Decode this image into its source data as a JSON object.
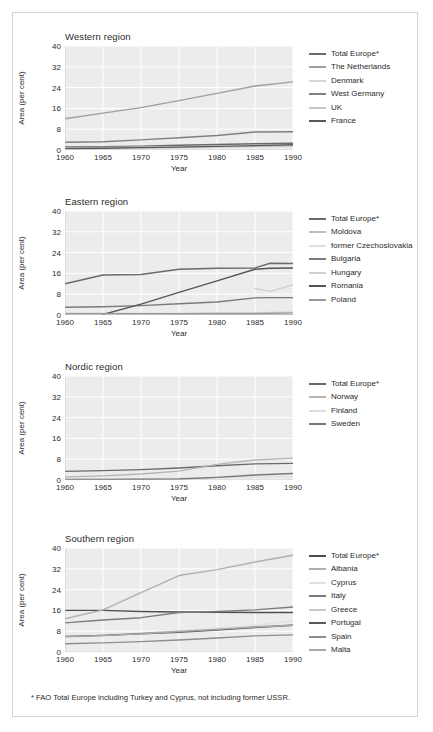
{
  "figure": {
    "footnote": "* FAO Total Europe including Turkey and Cyprus, not including former USSR.",
    "y_axis_label": "Area (per cent)",
    "x_axis_label": "Year"
  },
  "chart_data": [
    {
      "type": "line",
      "title": "Western region",
      "xlabel": "Year",
      "ylabel": "Area (per cent)",
      "xlim": [
        1960,
        1990
      ],
      "ylim": [
        0,
        40
      ],
      "xticks": [
        1960,
        1965,
        1970,
        1975,
        1980,
        1985,
        1990
      ],
      "yticks": [
        0,
        8,
        16,
        24,
        32,
        40
      ],
      "grid": true,
      "legend_position": "right",
      "x": [
        1960,
        1965,
        1970,
        1975,
        1980,
        1985,
        1990
      ],
      "series": [
        {
          "name": "Total Europe*",
          "color": "#6a6a6a",
          "values": [
            1.2,
            1.3,
            1.5,
            1.8,
            2.1,
            2.4,
            2.6
          ]
        },
        {
          "name": "The Netherlands",
          "color": "#9f9f9f",
          "values": [
            12.0,
            14.2,
            16.3,
            19.0,
            21.8,
            24.6,
            26.2
          ]
        },
        {
          "name": "Denmark",
          "color": "#d8d8d8",
          "values": [
            0.4,
            0.5,
            0.6,
            0.8,
            1.0,
            1.2,
            1.4
          ]
        },
        {
          "name": "West Germany",
          "color": "#808080",
          "values": [
            3.0,
            3.2,
            3.9,
            4.7,
            5.6,
            6.9,
            7.0
          ]
        },
        {
          "name": "UK",
          "color": "#c6c6c6",
          "values": [
            0.9,
            1.0,
            1.1,
            1.2,
            1.3,
            1.4,
            1.5
          ]
        },
        {
          "name": "France",
          "color": "#595959",
          "values": [
            0.6,
            0.7,
            0.9,
            1.1,
            1.4,
            1.7,
            2.0
          ]
        }
      ]
    },
    {
      "type": "line",
      "title": "Eastern region",
      "xlabel": "Year",
      "ylabel": "Area (per cent)",
      "xlim": [
        1960,
        1990
      ],
      "ylim": [
        0,
        40
      ],
      "xticks": [
        1960,
        1965,
        1970,
        1975,
        1980,
        1985,
        1990
      ],
      "yticks": [
        0,
        8,
        16,
        24,
        32,
        40
      ],
      "grid": true,
      "legend_position": "right",
      "x": [
        1960,
        1965,
        1970,
        1975,
        1980,
        1985,
        1987,
        1990
      ],
      "series": [
        {
          "name": "Total Europe*",
          "color": "#6a6a6a",
          "values": [
            12.0,
            15.4,
            15.6,
            17.6,
            18.0,
            18.1,
            19.9,
            19.8
          ]
        },
        {
          "name": "Moldova",
          "color": "#bfbfbf",
          "values": [
            0.6,
            0.6,
            0.5,
            0.4,
            0.3,
            0.2,
            0.1,
            0.1
          ]
        },
        {
          "name": "former Czechoslovakia",
          "color": "#e0e0e0",
          "values": [
            0.5,
            0.5,
            0.6,
            0.7,
            0.8,
            0.9,
            1.1,
            1.4
          ]
        },
        {
          "name": "Bulgaria",
          "color": "#7a7a7a",
          "values": [
            3.0,
            3.2,
            3.6,
            4.3,
            5.0,
            6.6,
            6.7,
            6.7
          ]
        },
        {
          "name": "Hungary",
          "color": "#cfcfcf",
          "values": [
            null,
            null,
            null,
            null,
            null,
            10.2,
            9.1,
            11.6
          ]
        },
        {
          "name": "Romania",
          "color": "#555555",
          "values": [
            null,
            0.2,
            4.2,
            8.7,
            13.1,
            17.6,
            18.0,
            18.1
          ]
        },
        {
          "name": "Poland",
          "color": "#999999",
          "values": [
            0.5,
            0.5,
            0.5,
            0.5,
            0.6,
            0.6,
            0.7,
            0.8
          ]
        }
      ]
    },
    {
      "type": "line",
      "title": "Nordic region",
      "xlabel": "Year",
      "ylabel": "Area (per cent)",
      "xlim": [
        1960,
        1990
      ],
      "ylim": [
        0,
        40
      ],
      "xticks": [
        1960,
        1965,
        1970,
        1975,
        1980,
        1985,
        1990
      ],
      "yticks": [
        0,
        8,
        16,
        24,
        32,
        40
      ],
      "grid": true,
      "legend_position": "right",
      "x": [
        1960,
        1965,
        1970,
        1975,
        1980,
        1985,
        1990
      ],
      "series": [
        {
          "name": "Total Europe*",
          "color": "#6a6a6a",
          "values": [
            3.3,
            3.6,
            4.0,
            4.6,
            5.5,
            6.2,
            6.4
          ]
        },
        {
          "name": "Norway",
          "color": "#b5b5b5",
          "values": [
            1.2,
            1.6,
            2.3,
            3.4,
            6.0,
            7.7,
            8.4
          ]
        },
        {
          "name": "Finland",
          "color": "#dedede",
          "values": [
            0.3,
            0.4,
            0.5,
            0.7,
            0.9,
            1.1,
            1.3
          ]
        },
        {
          "name": "Sweden",
          "color": "#777777",
          "values": [
            0.2,
            0.2,
            0.3,
            0.4,
            1.0,
            1.9,
            2.5
          ]
        }
      ]
    },
    {
      "type": "line",
      "title": "Southern region",
      "xlabel": "Year",
      "ylabel": "Area (per cent)",
      "xlim": [
        1960,
        1990
      ],
      "ylim": [
        0,
        40
      ],
      "xticks": [
        1960,
        1965,
        1970,
        1975,
        1980,
        1985,
        1990
      ],
      "yticks": [
        0,
        8,
        16,
        24,
        32,
        40
      ],
      "grid": true,
      "legend_position": "right",
      "x": [
        1960,
        1965,
        1970,
        1975,
        1980,
        1985,
        1990
      ],
      "series": [
        {
          "name": "Total Europe*",
          "color": "#4f4f4f",
          "values": [
            16.0,
            16.0,
            15.6,
            15.4,
            15.3,
            15.2,
            15.2
          ]
        },
        {
          "name": "Albania",
          "color": "#b0b0b0",
          "values": [
            12.8,
            16.2,
            22.8,
            29.4,
            31.7,
            34.6,
            37.2
          ]
        },
        {
          "name": "Cyprus",
          "color": "#e2e2e2",
          "values": [
            5.6,
            6.2,
            7.2,
            8.0,
            9.1,
            10.4,
            11.9
          ]
        },
        {
          "name": "Italy",
          "color": "#7c7c7c",
          "values": [
            11.2,
            12.3,
            13.2,
            15.2,
            15.6,
            16.2,
            17.3
          ]
        },
        {
          "name": "Greece",
          "color": "#c9c9c9",
          "values": [
            5.8,
            6.4,
            7.2,
            8.0,
            8.8,
            9.7,
            10.4
          ]
        },
        {
          "name": "Portugal",
          "color": "#5a5a5a",
          "values": [
            6.0,
            6.4,
            7.0,
            7.6,
            8.4,
            9.4,
            10.3
          ]
        },
        {
          "name": "Spain",
          "color": "#8d8d8d",
          "values": [
            3.2,
            3.5,
            4.0,
            4.6,
            5.4,
            6.2,
            6.6
          ]
        },
        {
          "name": "Malta",
          "color": "#a8a8a8",
          "values": [
            5.9,
            6.3,
            7.0,
            7.9,
            8.7,
            9.6,
            10.3
          ]
        }
      ]
    }
  ]
}
